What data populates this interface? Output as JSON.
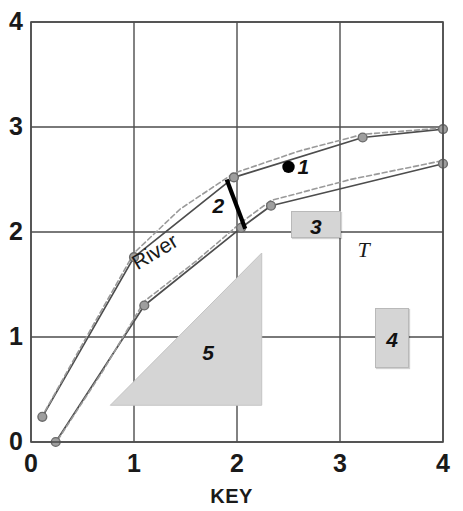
{
  "chart_data": {
    "type": "line",
    "title": "",
    "xlabel": "KEY",
    "ylabel": "",
    "xlim": [
      0,
      4
    ],
    "ylim": [
      0,
      4
    ],
    "grid": true,
    "legend_position": "none",
    "x_ticks": [
      "0",
      "1",
      "2",
      "3",
      "4"
    ],
    "y_ticks": [
      "0",
      "1",
      "2",
      "3",
      "4"
    ],
    "x_tick_values": [
      0,
      1,
      2,
      3,
      4
    ],
    "y_tick_values": [
      0,
      1,
      2,
      3,
      4
    ],
    "series": [
      {
        "name": "upper-bank-solid",
        "style": "solid",
        "color": "#4d4d4d",
        "markers": true,
        "x": [
          0.11,
          1.0,
          1.97,
          3.22,
          4.0
        ],
        "y": [
          0.24,
          1.76,
          2.52,
          2.9,
          2.98
        ]
      },
      {
        "name": "upper-bank-dashed",
        "style": "dashed",
        "color": "#9a9a9a",
        "markers": false,
        "x": [
          0.1,
          0.55,
          1.0,
          1.45,
          1.97,
          2.6,
          3.22,
          4.0
        ],
        "y": [
          0.23,
          1.02,
          1.8,
          2.22,
          2.56,
          2.77,
          2.93,
          2.99
        ]
      },
      {
        "name": "lower-bank-solid",
        "style": "solid",
        "color": "#4d4d4d",
        "markers": true,
        "x": [
          0.24,
          1.1,
          2.04,
          2.33,
          4.0
        ],
        "y": [
          0.0,
          1.3,
          2.04,
          2.25,
          2.65
        ]
      },
      {
        "name": "lower-bank-dashed",
        "style": "dashed",
        "color": "#9a9a9a",
        "markers": false,
        "x": [
          0.26,
          0.7,
          1.1,
          1.6,
          2.04,
          2.33,
          3.1,
          4.0
        ],
        "y": [
          0.02,
          0.68,
          1.34,
          1.72,
          2.09,
          2.3,
          2.5,
          2.68
        ]
      }
    ],
    "annotations": [
      {
        "name": "point-1",
        "label": "1",
        "kind": "dot-with-label",
        "x": 2.5,
        "y": 2.62
      },
      {
        "name": "segment-2",
        "label": "2",
        "kind": "thick-segment-with-label",
        "x1": 1.9,
        "y1": 2.5,
        "x2": 2.08,
        "y2": 2.03,
        "label_x": 1.83,
        "label_y": 2.25
      },
      {
        "name": "box-3",
        "label": "3",
        "kind": "gray-box",
        "x": 2.52,
        "y": 2.2,
        "w": 0.49,
        "h": 0.26
      },
      {
        "name": "box-4",
        "label": "4",
        "kind": "gray-box",
        "x": 3.34,
        "y": 1.28,
        "w": 0.33,
        "h": 0.58
      },
      {
        "name": "triangle-5",
        "label": "5",
        "kind": "gray-triangle",
        "x": 0.77,
        "y": 0.35,
        "label_x": 1.72,
        "label_y": 0.85
      },
      {
        "name": "label-T",
        "label": "T",
        "kind": "text",
        "x": 3.17,
        "y": 1.82
      },
      {
        "name": "label-river",
        "label": "River",
        "kind": "rotated-text",
        "x": 1.05,
        "y": 1.75,
        "rotation": -31
      }
    ]
  }
}
